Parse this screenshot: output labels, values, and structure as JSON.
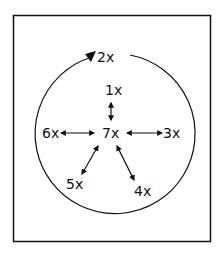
{
  "diagram": {
    "center_label": "7x",
    "circle_label": "2x",
    "labels": {
      "top": "1x",
      "right": "3x",
      "bottom_right": "4x",
      "bottom_left": "5x",
      "left": "6x"
    },
    "colors": {
      "stroke": "#111111",
      "background": "#ffffff"
    }
  }
}
